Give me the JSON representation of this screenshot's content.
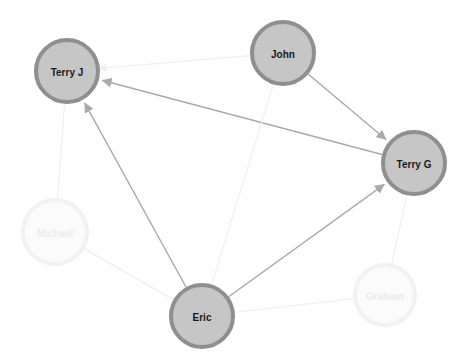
{
  "canvas": {
    "width": 468,
    "height": 359,
    "background": "#ffffff",
    "title": "Social network graph"
  },
  "style": {
    "node_fill": "#c6c6c6",
    "node_stroke": "#8f8f8f",
    "node_stroke_width": 4,
    "node_label_color": "#1a1a1a",
    "node_label_size": 10,
    "faded_node_fill": "#fbfbfb",
    "faded_node_stroke": "#f2f2f2",
    "faded_node_label_color": "#ececec",
    "edge_color_strong": "#a9a9a9",
    "edge_color_faint": "#f0f0f0",
    "edge_width_strong": 1.4,
    "edge_width_faint": 1.2,
    "arrow_color": "#a9a9a9"
  },
  "nodes": [
    {
      "id": "terry_j",
      "label": "Terry J",
      "cx": 67,
      "cy": 71,
      "r": 31,
      "state": "highlighted"
    },
    {
      "id": "john",
      "label": "John",
      "cx": 283,
      "cy": 53,
      "r": 31,
      "state": "highlighted"
    },
    {
      "id": "terry_g",
      "label": "Terry G",
      "cx": 414,
      "cy": 163,
      "r": 31,
      "state": "highlighted"
    },
    {
      "id": "eric",
      "label": "Eric",
      "cx": 202,
      "cy": 316,
      "r": 31,
      "state": "highlighted"
    },
    {
      "id": "michael",
      "label": "Michael",
      "cx": 55,
      "cy": 232,
      "r": 32,
      "state": "faded"
    },
    {
      "id": "graham",
      "label": "Graham",
      "cx": 385,
      "cy": 295,
      "r": 30,
      "state": "faded"
    }
  ],
  "edges": [
    {
      "id": "e_terryg_terryj",
      "source": "terry_g",
      "target": "terry_j",
      "directed": true,
      "emphasis": "strong"
    },
    {
      "id": "e_john_terryg",
      "source": "john",
      "target": "terry_g",
      "directed": true,
      "emphasis": "strong"
    },
    {
      "id": "e_eric_terryj",
      "source": "eric",
      "target": "terry_j",
      "directed": true,
      "emphasis": "strong"
    },
    {
      "id": "e_eric_terryg",
      "source": "eric",
      "target": "terry_g",
      "directed": true,
      "emphasis": "strong"
    },
    {
      "id": "e_john_terryj",
      "source": "john",
      "target": "terry_j",
      "directed": true,
      "emphasis": "faint"
    },
    {
      "id": "e_john_eric",
      "source": "john",
      "target": "eric",
      "directed": false,
      "emphasis": "faint"
    },
    {
      "id": "e_terryj_michael",
      "source": "terry_j",
      "target": "michael",
      "directed": false,
      "emphasis": "faint"
    },
    {
      "id": "e_michael_eric",
      "source": "michael",
      "target": "eric",
      "directed": false,
      "emphasis": "faint"
    },
    {
      "id": "e_eric_graham",
      "source": "eric",
      "target": "graham",
      "directed": false,
      "emphasis": "faint"
    },
    {
      "id": "e_graham_terryg",
      "source": "graham",
      "target": "terry_g",
      "directed": false,
      "emphasis": "faint"
    }
  ]
}
